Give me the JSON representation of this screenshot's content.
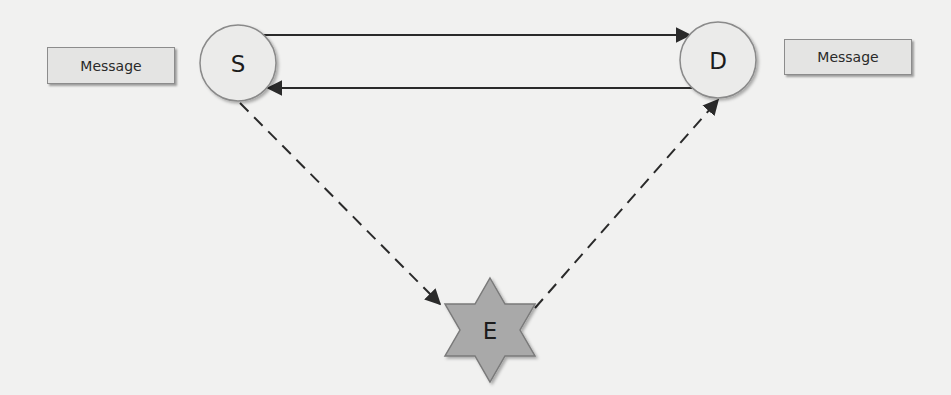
{
  "nodes": {
    "source": {
      "label": "S",
      "cx": 238,
      "cy": 63,
      "r": 38
    },
    "destination": {
      "label": "D",
      "cx": 718,
      "cy": 60,
      "r": 38
    },
    "eavesdropper": {
      "label": "E",
      "cx": 490,
      "cy": 330,
      "r": 52
    }
  },
  "messages": {
    "left": {
      "label": "Message"
    },
    "right": {
      "label": "Message"
    }
  },
  "edges": [
    {
      "from": "S",
      "to": "D",
      "style": "solid",
      "direction": "S→D"
    },
    {
      "from": "D",
      "to": "S",
      "style": "solid",
      "direction": "D→S"
    },
    {
      "from": "S",
      "to": "E",
      "style": "dashed",
      "direction": "S→E"
    },
    {
      "from": "E",
      "to": "D",
      "style": "dashed",
      "direction": "E→D"
    }
  ],
  "colors": {
    "background": "#f1f1f0",
    "circle_fill": "#ebebea",
    "star_fill": "#a9a9a9",
    "line": "#2a2a2a"
  }
}
